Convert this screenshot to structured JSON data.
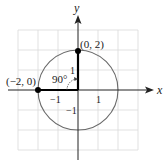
{
  "figure": {
    "type": "coordinate-plane",
    "axes": {
      "x_label": "x",
      "y_label": "y"
    },
    "ticks": {
      "x_neg": "−1",
      "x_pos": "1",
      "y_pos": "1",
      "y_neg": "−1"
    },
    "points": [
      {
        "label": "(0, 2)",
        "x": 0,
        "y": 2
      },
      {
        "label": "(−2, 0)",
        "x": -2,
        "y": 0
      }
    ],
    "circle": {
      "center": [
        0,
        0
      ],
      "radius": 2
    },
    "angle_label": "90°",
    "colors": {
      "axis": "#222222",
      "grid": "#d9d9d9",
      "circle": "#6a6a6a",
      "points": "#000000"
    }
  }
}
